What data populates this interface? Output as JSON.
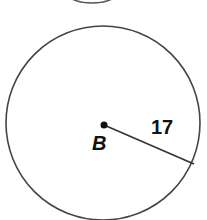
{
  "diagram": {
    "center_label": "B",
    "radius_label": "17",
    "colors": {
      "stroke": "#444444",
      "text": "#111111"
    }
  }
}
